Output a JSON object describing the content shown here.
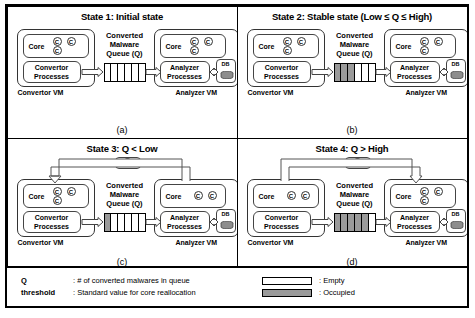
{
  "figure": {
    "panels": [
      {
        "id": "state-1",
        "title": "State 1: Initial state",
        "letter": "(a)",
        "convertor": {
          "vm_label": "Convertor VM",
          "core_label": "Core",
          "cores": 3,
          "process_line1": "Convertor",
          "process_line2": "Processes"
        },
        "queue": {
          "title_line1": "Converted",
          "title_line2": "Malware",
          "title_line3": "Queue (Q)",
          "cells": 6,
          "filled": 0
        },
        "analyzer": {
          "vm_label": "Analyzer VM",
          "core_label": "Core",
          "cores": 3,
          "process_line1": "Analyzer",
          "process_line2": "Processes",
          "db_label": "DB"
        },
        "realloc": {
          "show": false,
          "direction": "",
          "chip_label": "C"
        }
      },
      {
        "id": "state-2",
        "title": "State 2: Stable state (Low ≤ Q ≤ High)",
        "letter": "(b)",
        "convertor": {
          "vm_label": "Convertor VM",
          "core_label": "Core",
          "cores": 3,
          "process_line1": "Convertor",
          "process_line2": "Processes"
        },
        "queue": {
          "title_line1": "Converted",
          "title_line2": "Malware",
          "title_line3": "Queue (Q)",
          "cells": 6,
          "filled": 3
        },
        "analyzer": {
          "vm_label": "Analyzer VM",
          "core_label": "Core",
          "cores": 3,
          "process_line1": "Analyzer",
          "process_line2": "Processes",
          "db_label": "DB"
        },
        "realloc": {
          "show": false,
          "direction": "",
          "chip_label": "C"
        }
      },
      {
        "id": "state-3",
        "title": "State 3: Q < Low",
        "letter": "(c)",
        "convertor": {
          "vm_label": "Convertor VM",
          "core_label": "Core",
          "cores": 3,
          "process_line1": "Convertor",
          "process_line2": "Processes"
        },
        "queue": {
          "title_line1": "Converted",
          "title_line2": "Malware",
          "title_line3": "Queue (Q)",
          "cells": 6,
          "filled": 1
        },
        "analyzer": {
          "vm_label": "Analyzer VM",
          "core_label": "Core",
          "cores": 2,
          "process_line1": "Analyzer",
          "process_line2": "Processes",
          "db_label": "DB"
        },
        "realloc": {
          "show": true,
          "direction": "to-convertor",
          "chip_label": "C"
        }
      },
      {
        "id": "state-4",
        "title": "State 4: Q > High",
        "letter": "(d)",
        "convertor": {
          "vm_label": "Convertor VM",
          "core_label": "Core",
          "cores": 2,
          "process_line1": "Convertor",
          "process_line2": "Processes"
        },
        "queue": {
          "title_line1": "Converted",
          "title_line2": "Malware",
          "title_line3": "Queue (Q)",
          "cells": 6,
          "filled": 5
        },
        "analyzer": {
          "vm_label": "Analyzer VM",
          "core_label": "Core",
          "cores": 3,
          "process_line1": "Analyzer",
          "process_line2": "Processes",
          "db_label": "DB"
        },
        "realloc": {
          "show": true,
          "direction": "to-analyzer",
          "chip_label": "C"
        }
      }
    ],
    "legend": {
      "definitions": [
        {
          "key": "Q",
          "value": ": # of converted malwares in queue"
        },
        {
          "key": "threshold",
          "value": ": Standard value for core reallocation"
        }
      ],
      "swatches": [
        {
          "label": ": Empty",
          "state": "empty"
        },
        {
          "label": ": Occupied",
          "state": "occupied"
        }
      ]
    },
    "colors": {
      "occupied_fill": "#9a9a9a",
      "stroke": "#000000",
      "background": "#ffffff"
    }
  }
}
